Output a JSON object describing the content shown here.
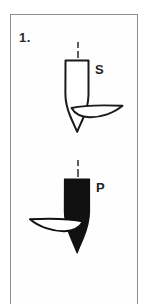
{
  "figure": {
    "number_label": "1.",
    "frame_color": "#8f8f8f",
    "background_color": "#ffffff",
    "ink_color": "#111111",
    "width": 147,
    "height": 293
  },
  "specimens": [
    {
      "id": "specimen-s",
      "label": "S",
      "fill_style": "outline",
      "fill_color": "#ffffff",
      "stroke_color": "#111111",
      "axis_line_style": "dashed",
      "blade_side": "right",
      "label_position": "right"
    },
    {
      "id": "specimen-p",
      "label": "P",
      "fill_style": "solid",
      "fill_color": "#111111",
      "stroke_color": "#111111",
      "axis_line_style": "dashed",
      "blade_side": "left",
      "label_position": "right"
    }
  ],
  "annotations": {
    "s_letter": "S",
    "p_letter": "P",
    "item_number": "1."
  }
}
